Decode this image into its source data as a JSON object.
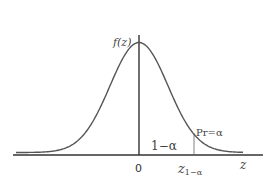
{
  "chart_data": {
    "type": "line",
    "title": "",
    "ylabel": "f(z)",
    "xlabel": "z",
    "x_ticks": [
      "0",
      "z₁₋α"
    ],
    "annotations": {
      "central_area": "1−α",
      "tail_area": "Pr=α"
    },
    "curve": "normal pdf, mean 0, sd 1",
    "x_range": [
      -3.5,
      3.5
    ],
    "quantile_marker": "z₁₋α",
    "grid": false,
    "legend": "none"
  },
  "labels": {
    "y_axis": "f(z)",
    "x_axis": "z",
    "origin": "0",
    "quantile_main": "z",
    "quantile_sub": "1−α",
    "central": "1−α",
    "tail": "Pr=α"
  }
}
